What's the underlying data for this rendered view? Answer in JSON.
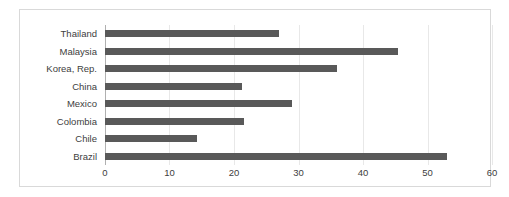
{
  "chart_data": {
    "type": "bar",
    "orientation": "horizontal",
    "title": "",
    "subtitle": "",
    "xlabel": "",
    "ylabel": "",
    "categories": [
      "Thailand",
      "Malaysia",
      "Korea, Rep.",
      "China",
      "Mexico",
      "Colombia",
      "Chile",
      "Brazil"
    ],
    "values": [
      27,
      45.5,
      36,
      21.3,
      29,
      21.5,
      14.3,
      53
    ],
    "series": [
      {
        "name": "",
        "values": [
          27,
          45.5,
          36,
          21.3,
          29,
          21.5,
          14.3,
          53
        ]
      }
    ],
    "xlim": [
      0,
      60
    ],
    "xticks": [
      0,
      10,
      20,
      30,
      40,
      50,
      60
    ],
    "xtick_labels": [
      "0",
      "10",
      "20",
      "30",
      "40",
      "50",
      "60"
    ],
    "grid": true,
    "grid_axis": "x",
    "legend": false,
    "legend_position": "none",
    "bar_color": "#595959",
    "grid_color": "#e8e8e8",
    "axis_color": "#b0b0b0",
    "frame_color": "#d9d9d9",
    "background_color": "#ffffff",
    "text_color": "#404040"
  }
}
